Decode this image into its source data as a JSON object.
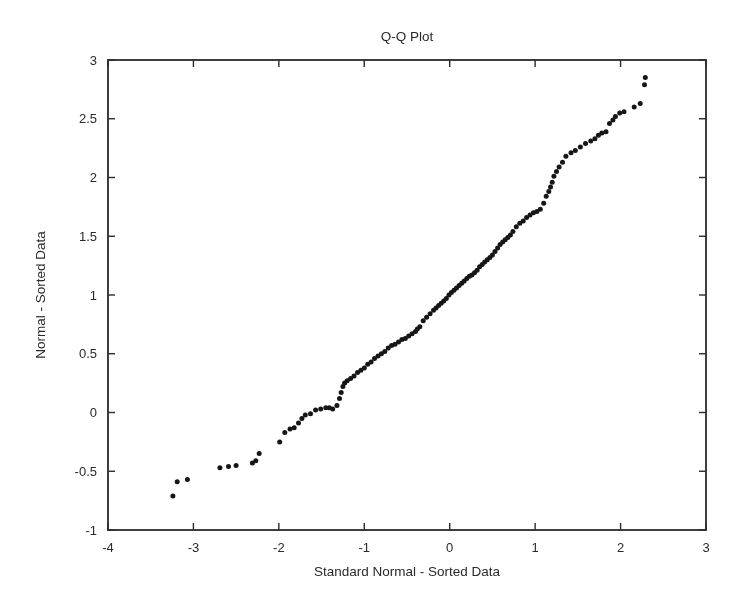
{
  "figure": {
    "title": "Q-Q Plot",
    "xlabel": "Standard Normal - Sorted Data",
    "ylabel": "Normal - Sorted Data"
  },
  "chart_data": {
    "type": "scatter",
    "title": "Q-Q Plot",
    "xlabel": "Standard Normal - Sorted Data",
    "ylabel": "Normal - Sorted Data",
    "xlim": [
      -4,
      3
    ],
    "ylim": [
      -1,
      3
    ],
    "x_ticks": [
      -4,
      -3,
      -2,
      -1,
      0,
      1,
      2,
      3
    ],
    "y_ticks": [
      -1,
      -0.5,
      0,
      0.5,
      1,
      1.5,
      2,
      2.5,
      3
    ],
    "grid": false,
    "legend": null,
    "box": true,
    "marker": {
      "shape": "dot",
      "color": "#161616",
      "radius_px": 2.5
    },
    "axis_color": "#2b2b2b",
    "background_color": "#ffffff",
    "points": [
      [
        -3.24,
        -0.71
      ],
      [
        -3.19,
        -0.59
      ],
      [
        -3.07,
        -0.57
      ],
      [
        -2.69,
        -0.47
      ],
      [
        -2.59,
        -0.46
      ],
      [
        -2.5,
        -0.45
      ],
      [
        -2.31,
        -0.43
      ],
      [
        -2.27,
        -0.41
      ],
      [
        -2.23,
        -0.35
      ],
      [
        -1.99,
        -0.25
      ],
      [
        -1.93,
        -0.17
      ],
      [
        -1.87,
        -0.14
      ],
      [
        -1.82,
        -0.13
      ],
      [
        -1.77,
        -0.09
      ],
      [
        -1.73,
        -0.05
      ],
      [
        -1.69,
        -0.02
      ],
      [
        -1.63,
        -0.01
      ],
      [
        -1.57,
        0.02
      ],
      [
        -1.51,
        0.03
      ],
      [
        -1.45,
        0.04
      ],
      [
        -1.41,
        0.04
      ],
      [
        -1.37,
        0.03
      ],
      [
        -1.32,
        0.06
      ],
      [
        -1.29,
        0.12
      ],
      [
        -1.27,
        0.17
      ],
      [
        -1.25,
        0.22
      ],
      [
        -1.23,
        0.25
      ],
      [
        -1.2,
        0.27
      ],
      [
        -1.16,
        0.29
      ],
      [
        -1.12,
        0.31
      ],
      [
        -1.08,
        0.34
      ],
      [
        -1.04,
        0.36
      ],
      [
        -1.0,
        0.38
      ],
      [
        -0.96,
        0.41
      ],
      [
        -0.92,
        0.43
      ],
      [
        -0.88,
        0.46
      ],
      [
        -0.84,
        0.48
      ],
      [
        -0.8,
        0.5
      ],
      [
        -0.76,
        0.52
      ],
      [
        -0.72,
        0.55
      ],
      [
        -0.68,
        0.57
      ],
      [
        -0.64,
        0.58
      ],
      [
        -0.6,
        0.6
      ],
      [
        -0.56,
        0.62
      ],
      [
        -0.52,
        0.63
      ],
      [
        -0.48,
        0.65
      ],
      [
        -0.44,
        0.67
      ],
      [
        -0.4,
        0.69
      ],
      [
        -0.38,
        0.71
      ],
      [
        -0.35,
        0.73
      ],
      [
        -0.31,
        0.78
      ],
      [
        -0.27,
        0.81
      ],
      [
        -0.23,
        0.84
      ],
      [
        -0.19,
        0.87
      ],
      [
        -0.16,
        0.89
      ],
      [
        -0.13,
        0.91
      ],
      [
        -0.1,
        0.93
      ],
      [
        -0.07,
        0.95
      ],
      [
        -0.04,
        0.97
      ],
      [
        -0.01,
        1.0
      ],
      [
        0.02,
        1.02
      ],
      [
        0.05,
        1.04
      ],
      [
        0.08,
        1.06
      ],
      [
        0.11,
        1.08
      ],
      [
        0.14,
        1.1
      ],
      [
        0.17,
        1.12
      ],
      [
        0.2,
        1.14
      ],
      [
        0.23,
        1.16
      ],
      [
        0.26,
        1.17
      ],
      [
        0.29,
        1.19
      ],
      [
        0.32,
        1.21
      ],
      [
        0.35,
        1.24
      ],
      [
        0.38,
        1.26
      ],
      [
        0.41,
        1.28
      ],
      [
        0.44,
        1.3
      ],
      [
        0.47,
        1.32
      ],
      [
        0.5,
        1.34
      ],
      [
        0.53,
        1.37
      ],
      [
        0.56,
        1.4
      ],
      [
        0.59,
        1.43
      ],
      [
        0.62,
        1.45
      ],
      [
        0.65,
        1.47
      ],
      [
        0.68,
        1.49
      ],
      [
        0.71,
        1.51
      ],
      [
        0.74,
        1.54
      ],
      [
        0.78,
        1.58
      ],
      [
        0.82,
        1.61
      ],
      [
        0.86,
        1.63
      ],
      [
        0.9,
        1.66
      ],
      [
        0.94,
        1.68
      ],
      [
        0.98,
        1.7
      ],
      [
        1.02,
        1.71
      ],
      [
        1.06,
        1.73
      ],
      [
        1.1,
        1.78
      ],
      [
        1.13,
        1.84
      ],
      [
        1.16,
        1.88
      ],
      [
        1.18,
        1.92
      ],
      [
        1.2,
        1.96
      ],
      [
        1.22,
        2.01
      ],
      [
        1.25,
        2.05
      ],
      [
        1.28,
        2.09
      ],
      [
        1.32,
        2.13
      ],
      [
        1.36,
        2.18
      ],
      [
        1.42,
        2.21
      ],
      [
        1.47,
        2.23
      ],
      [
        1.53,
        2.26
      ],
      [
        1.59,
        2.29
      ],
      [
        1.65,
        2.31
      ],
      [
        1.7,
        2.33
      ],
      [
        1.74,
        2.36
      ],
      [
        1.78,
        2.38
      ],
      [
        1.83,
        2.39
      ],
      [
        1.87,
        2.46
      ],
      [
        1.91,
        2.49
      ],
      [
        1.94,
        2.52
      ],
      [
        1.99,
        2.55
      ],
      [
        2.04,
        2.56
      ],
      [
        2.16,
        2.6
      ],
      [
        2.23,
        2.63
      ],
      [
        2.28,
        2.79
      ],
      [
        2.29,
        2.85
      ]
    ]
  }
}
